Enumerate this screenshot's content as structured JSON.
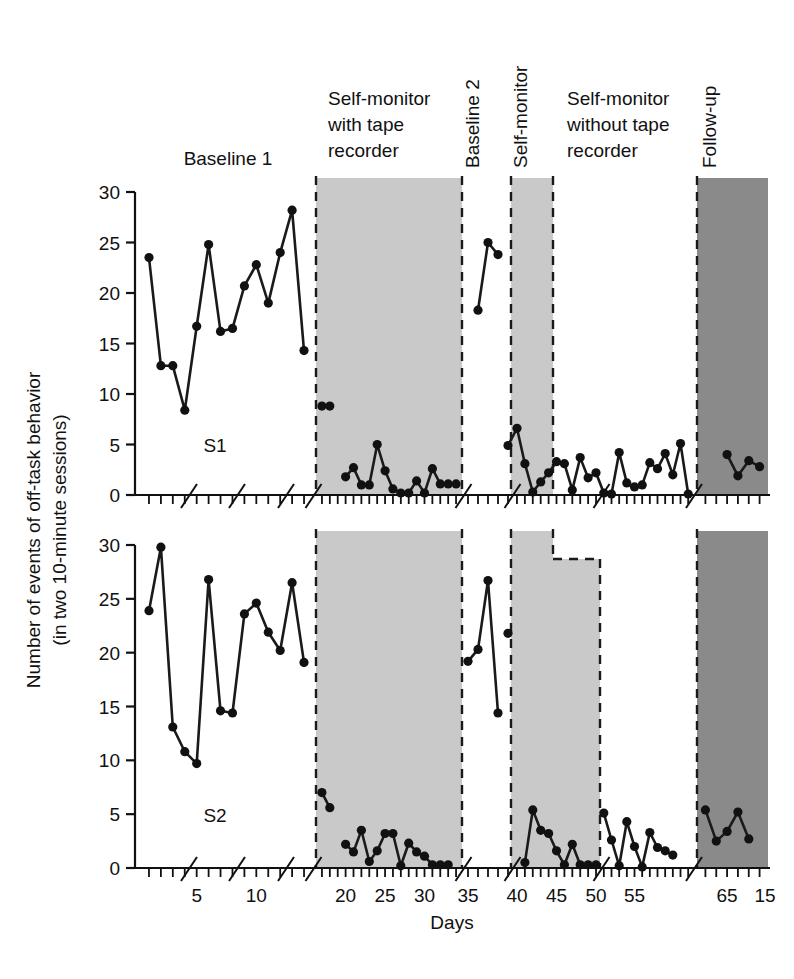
{
  "figure": {
    "axis_titles": {
      "x": "Days",
      "y_line1": "Number of events of off-task behavior",
      "y_line2": "(in two 10-minute sessions)"
    },
    "x_tick_labels": [
      "5",
      "10",
      "15",
      "20",
      "25",
      "30",
      "35",
      "40",
      "45",
      "50",
      "55",
      "65"
    ],
    "y_tick_labels_top": [
      "0",
      "5",
      "10",
      "15",
      "20",
      "25",
      "30"
    ],
    "y_tick_labels_bottom": [
      "0",
      "5",
      "10",
      "15",
      "20",
      "25",
      "30"
    ],
    "panel_labels": {
      "top": "S1",
      "bottom": "S2"
    },
    "phase_labels": [
      {
        "id": "baseline1",
        "text": "Baseline 1",
        "orientation": "horizontal"
      },
      {
        "id": "sm-tape",
        "text": "Self-monitor\nwith tape\nrecorder",
        "orientation": "horizontal"
      },
      {
        "id": "baseline2",
        "text": "Baseline 2",
        "orientation": "vertical"
      },
      {
        "id": "self-monitor",
        "text": "Self-monitor",
        "orientation": "vertical"
      },
      {
        "id": "sm-notape",
        "text": "Self-monitor\nwithout tape\nrecorder",
        "orientation": "horizontal"
      },
      {
        "id": "followup",
        "text": "Follow-up",
        "orientation": "vertical"
      }
    ],
    "phase_label_lines": {
      "sm_tape": [
        "Self-monitor",
        "with tape",
        "recorder"
      ],
      "sm_notape": [
        "Self-monitor",
        "without tape",
        "recorder"
      ],
      "baseline1": "Baseline 1",
      "baseline2": "Baseline 2",
      "self_monitor": "Self-monitor",
      "followup": "Follow-up"
    },
    "colors": {
      "shade_light": "#c9c9c9",
      "shade_dark": "#8a8a8a",
      "line": "#1a1a1a",
      "marker": "#111111",
      "axis": "#111111",
      "background": "#ffffff"
    }
  },
  "chart_data": {
    "type": "line",
    "title": "",
    "xlabel": "Days",
    "ylabel": "Number of events of off-task behavior (in two 10-minute sessions)",
    "xlim": [
      0,
      70
    ],
    "ylim": [
      0,
      30
    ],
    "x_ticks": [
      5,
      10,
      15,
      20,
      25,
      30,
      35,
      40,
      45,
      50,
      55,
      65
    ],
    "y_ticks": [
      0,
      5,
      10,
      15,
      20,
      25,
      30
    ],
    "grid": false,
    "legend": "none",
    "axis_breaks": true,
    "panels": [
      {
        "name": "S1",
        "label": "S1",
        "phases": [
          {
            "name": "Baseline 1",
            "shaded": false,
            "x": [
              1,
              2,
              3,
              4,
              5,
              6,
              7,
              8,
              9,
              10,
              11,
              12,
              13,
              14
            ],
            "y": [
              23.5,
              12.8,
              12.8,
              8.4,
              16.7,
              24.8,
              16.2,
              16.5,
              20.7,
              22.8,
              19.0,
              24.0,
              28.2,
              14.3
            ]
          },
          {
            "name": "Self-monitor with tape recorder",
            "shaded": "light",
            "x": [
              17,
              18
            ],
            "y": [
              8.8,
              8.8
            ]
          },
          {
            "name": "Self-monitor with tape recorder (cont)",
            "shaded": "light",
            "x": [
              20,
              21,
              22,
              23,
              24,
              25,
              26,
              27,
              28,
              29,
              30,
              31,
              32,
              33,
              34
            ],
            "y": [
              1.8,
              2.7,
              1.0,
              1.0,
              5.0,
              2.4,
              0.6,
              0.2,
              0.2,
              1.4,
              0.2,
              2.6,
              1.1,
              1.1,
              1.1
            ]
          },
          {
            "name": "Baseline 2",
            "shaded": false,
            "x": [
              36,
              37,
              38
            ],
            "y": [
              18.3,
              25.0,
              23.8
            ]
          },
          {
            "name": "Self-monitor",
            "shaded": "light",
            "x": [
              39,
              40,
              41,
              42,
              43,
              44,
              45
            ],
            "y": [
              4.9,
              6.6,
              3.1,
              0.3,
              1.3,
              2.2,
              3.3
            ]
          },
          {
            "name": "Self-monitor without tape recorder",
            "shaded": false,
            "x": [
              46,
              47,
              48,
              49,
              50,
              51,
              52,
              53,
              54,
              55,
              56,
              57,
              58,
              59,
              60,
              61,
              62
            ],
            "y": [
              3.1,
              0.5,
              3.7,
              1.7,
              2.2,
              0.2,
              0.1,
              4.2,
              1.2,
              0.8,
              1.0,
              3.2,
              2.6,
              4.1,
              2.0,
              5.1,
              0.1
            ]
          },
          {
            "name": "Follow-up",
            "shaded": "dark",
            "x": [
              65,
              66,
              67,
              68
            ],
            "y": [
              4.0,
              1.9,
              3.4,
              2.8
            ]
          }
        ]
      },
      {
        "name": "S2",
        "label": "S2",
        "phases": [
          {
            "name": "Baseline 1",
            "shaded": false,
            "x": [
              1,
              2,
              3,
              4,
              5,
              6,
              7,
              8,
              9,
              10,
              11,
              12,
              13,
              14
            ],
            "y": [
              23.9,
              29.8,
              13.1,
              10.8,
              9.7,
              26.8,
              14.6,
              14.4,
              23.6,
              24.6,
              21.9,
              20.2,
              26.5,
              19.1
            ]
          },
          {
            "name": "Self-monitor with tape recorder",
            "shaded": "light",
            "x": [
              17,
              18
            ],
            "y": [
              7.0,
              5.6
            ]
          },
          {
            "name": "Self-monitor with tape recorder (cont)",
            "shaded": "light",
            "x": [
              20,
              21,
              22,
              23,
              24,
              25,
              26,
              27,
              28,
              29,
              30,
              31,
              32,
              33
            ],
            "y": [
              2.2,
              1.5,
              3.5,
              0.6,
              1.6,
              3.2,
              3.2,
              0.2,
              2.3,
              1.5,
              1.1,
              0.3,
              0.3,
              0.3
            ]
          },
          {
            "name": "Baseline 2",
            "shaded": false,
            "x": [
              35,
              36,
              37,
              38
            ],
            "y": [
              19.2,
              20.3,
              26.7,
              14.4
            ]
          },
          {
            "name": "Baseline 2 (cont)",
            "shaded": false,
            "x": [
              39
            ],
            "y": [
              21.8
            ]
          },
          {
            "name": "Self-monitor",
            "shaded": "light",
            "x": [
              41,
              42,
              43,
              44,
              45,
              46,
              47,
              48,
              49,
              50
            ],
            "y": [
              0.5,
              5.4,
              3.5,
              3.2,
              1.6,
              0.3,
              2.2,
              0.3,
              0.3,
              0.3
            ]
          },
          {
            "name": "Self-monitor without tape recorder",
            "shaded": false,
            "x": [
              51,
              52,
              53,
              54,
              55,
              56,
              57,
              58,
              59,
              60
            ],
            "y": [
              5.1,
              2.6,
              0.2,
              4.3,
              2.0,
              0.1,
              3.3,
              1.9,
              1.6,
              1.2
            ]
          },
          {
            "name": "Follow-up",
            "shaded": "dark",
            "x": [
              63,
              64,
              65,
              66,
              67
            ],
            "y": [
              5.4,
              2.5,
              3.4,
              5.2,
              2.7
            ]
          }
        ]
      }
    ]
  }
}
